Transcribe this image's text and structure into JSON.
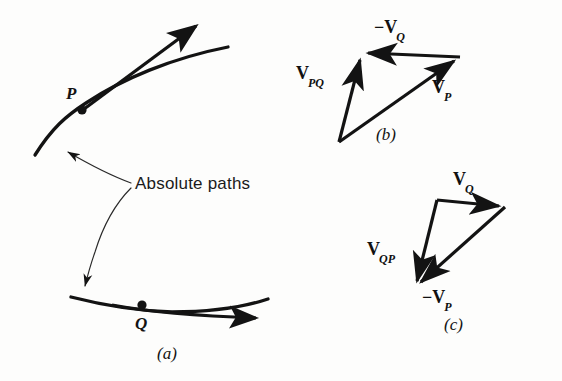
{
  "figure": {
    "background_color": "#fdfdfc",
    "ink_color": "#131313"
  },
  "panel_a": {
    "caption": "(a)",
    "callout_text": "Absolute paths",
    "point_p_label": "P",
    "point_q_label": "Q",
    "description": "Two curved absolute paths, each with a tangent velocity arrow; upper path passes through point P, lower path through point Q.",
    "upper_path": {
      "start": [
        35,
        155
      ],
      "control": [
        110,
        70
      ],
      "end": [
        228,
        48
      ],
      "tangent_arrow_start": [
        82,
        110
      ],
      "tangent_arrow_end": [
        199,
        23
      ]
    },
    "lower_path": {
      "start": [
        72,
        297
      ],
      "control": [
        170,
        317
      ],
      "end": [
        268,
        299
      ],
      "tangent_arrow_start": [
        110,
        305
      ],
      "tangent_arrow_end": [
        262,
        317
      ]
    },
    "callout_leader_upper": {
      "text_anchor": [
        133,
        185
      ],
      "arrow_tip": [
        57,
        148
      ]
    },
    "callout_leader_lower": {
      "text_anchor": [
        133,
        187
      ],
      "arrow_tip": [
        82,
        290
      ]
    }
  },
  "panel_b": {
    "caption": "(b)",
    "description": "Vector triangle: V_P plus minus V_Q gives V_PQ.",
    "vertices": {
      "bottom": [
        339,
        142
      ],
      "apex": [
        361,
        53
      ],
      "right": [
        460,
        57
      ]
    },
    "vectors": [
      {
        "name": "V_PQ",
        "label_main": "V",
        "label_sub": "PQ",
        "label_sign": "",
        "from": [
          339,
          142
        ],
        "to": [
          361,
          53
        ],
        "label_pos": [
          298,
          66
        ]
      },
      {
        "name": "-V_Q",
        "label_main": "V",
        "label_sub": "Q",
        "label_sign": "−",
        "from": [
          460,
          57
        ],
        "to": [
          361,
          53
        ],
        "label_pos": [
          376,
          21
        ]
      },
      {
        "name": "V_P",
        "label_main": "V",
        "label_sub": "P",
        "label_sign": "",
        "from": [
          339,
          142
        ],
        "to": [
          460,
          57
        ],
        "label_pos": [
          434,
          80
        ]
      }
    ],
    "caption_pos": [
      378,
      128
    ]
  },
  "panel_c": {
    "caption": "(c)",
    "description": "Vector triangle: V_Q plus minus V_P gives V_QP.",
    "vertices": {
      "apex": [
        437,
        200
      ],
      "right": [
        505,
        207
      ],
      "bottom": [
        415,
        287
      ]
    },
    "vectors": [
      {
        "name": "V_Q",
        "label_main": "V",
        "label_sub": "Q",
        "label_sign": "",
        "from": [
          437,
          200
        ],
        "to": [
          505,
          207
        ],
        "label_pos": [
          455,
          173
        ]
      },
      {
        "name": "V_QP",
        "label_main": "V",
        "label_sub": "QP",
        "label_sign": "",
        "from": [
          437,
          200
        ],
        "to": [
          415,
          287
        ],
        "label_pos": [
          369,
          243
        ]
      },
      {
        "name": "-V_P",
        "label_main": "V",
        "label_sub": "P",
        "label_sign": "−",
        "from": [
          505,
          207
        ],
        "to": [
          415,
          287
        ],
        "label_pos": [
          424,
          291
        ]
      }
    ],
    "caption_pos": [
      446,
      318
    ]
  }
}
